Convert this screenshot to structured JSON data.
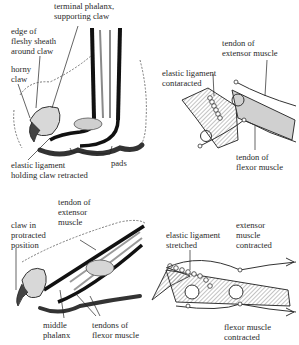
{
  "figure": {
    "panels": [
      {
        "id": "retracted-paw",
        "labels": {
          "terminal_phalanx": "terminal phalanx,\nsupporting claw",
          "edge_sheath": "edge of\nfleshy sheath\naround claw",
          "horny_claw": "horny\nclaw",
          "elastic_ligament": "elastic ligament\nholding claw retracted",
          "pads": "pads"
        }
      },
      {
        "id": "retracted-schematic",
        "labels": {
          "tendon_extensor": "tendon of\nextensor muscle",
          "elastic_ligament": "elastic ligament\ncontaracted",
          "tendon_flexor": "tendon of\nflexor muscle"
        }
      },
      {
        "id": "protracted-paw",
        "labels": {
          "claw_protracted": "claw in\nprotracted\nposition",
          "tendon_extensor": "tendon of\nextensor\nmuscle",
          "middle_phalanx": "middle\nphalanx",
          "tendons_flexor": "tendons of\nflexor muscle"
        }
      },
      {
        "id": "protracted-schematic",
        "labels": {
          "elastic_ligament": "elastic ligament\nstretched",
          "extensor_contracted": "extensor\nmuscle\ncontracted",
          "flexor_contracted": "flexor muscle\ncontracted"
        }
      }
    ],
    "colors": {
      "ink": "#1a1a1a",
      "shade": "#b8b8b8",
      "fur": "#8a8a8a",
      "pad": "#3a3a3a"
    }
  }
}
